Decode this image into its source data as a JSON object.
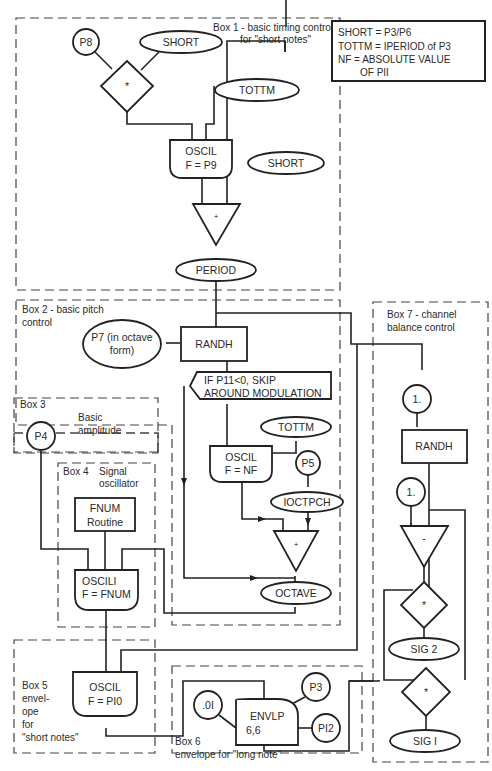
{
  "legend": {
    "lines": [
      "SHORT = P3/P6",
      "TOTTM = IPERIOD  of P3",
      "NF = ABSOLUTE VALUE",
      "OF PII"
    ]
  },
  "boxes": {
    "box1": {
      "title_line1": "Box 1 - basic timing control",
      "title_line2": "for \"short notes\""
    },
    "box2": {
      "title_line1": "Box 2 - basic pitch",
      "title_line2": "control"
    },
    "box3": {
      "title": "Box 3",
      "desc_line1": "Basic",
      "desc_line2": "amplitude"
    },
    "box4": {
      "title": "Box 4",
      "desc_line1": "Signal",
      "desc_line2": "oscillator"
    },
    "box5": {
      "lines": [
        "Box 5",
        "envel-",
        "ope",
        "for",
        "\"short notes\""
      ]
    },
    "box6": {
      "title": "Box 6",
      "desc": "envelope for \"long note\""
    },
    "box7": {
      "title_line1": "Box 7 - channel",
      "title_line2": "balance control"
    }
  },
  "nodes": {
    "p8": "P8",
    "short1": "SHORT",
    "mult1": "*",
    "tottm1": "TOTTM",
    "oscil1": {
      "line1": "OSCIL",
      "line2": "F = P9"
    },
    "short2": "SHORT",
    "add1": "+",
    "period": "PERIOD",
    "p7": {
      "line1": "P7 (in octave",
      "line2": "form)"
    },
    "randh1": "RANDH",
    "if_stmt": {
      "line1": "IF P11<0, SKIP",
      "line2": "AROUND MODULATION"
    },
    "tottm2": "TOTTM",
    "oscil_nf": {
      "line1": "OSCIL",
      "line2": "F = NF"
    },
    "p5": "P5",
    "ioctpch": "IOCTPCH",
    "add2": "+",
    "octave": "OCTAVE",
    "p4": "P4",
    "fnum": {
      "line1": "FNUM",
      "line2": "Routine"
    },
    "oscili": {
      "line1": "OSCILI",
      "line2": "F = FNUM"
    },
    "oscil_p10": {
      "line1": "OSCIL",
      "line2": "F = PI0"
    },
    "c01": ".0I",
    "envlp": {
      "line1": "ENVLP",
      "line2": "6,6"
    },
    "p3": "P3",
    "p12": "PI2",
    "one_a": "1.",
    "randh2": "RANDH",
    "one_b": "1.",
    "sub": "-",
    "mult2": "*",
    "sig2": "SIG 2",
    "mult3": "*",
    "sig1": "SIG I"
  },
  "colors": {
    "ink": "#222222",
    "paper": "#ffffff"
  }
}
